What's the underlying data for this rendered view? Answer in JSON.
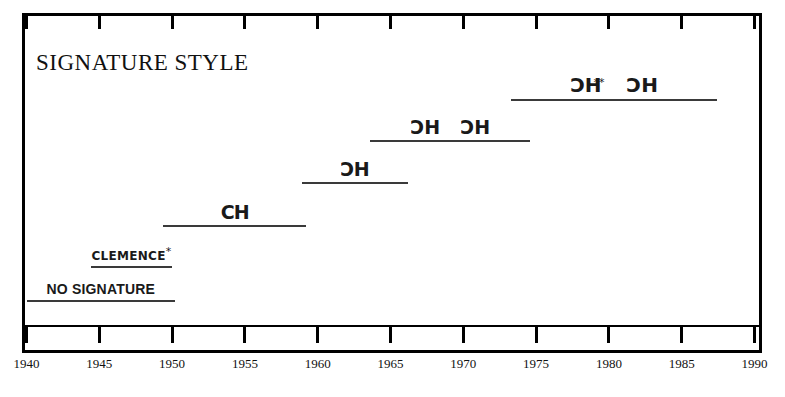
{
  "chart_data": {
    "type": "bar",
    "orientation": "horizontal-timeline",
    "title": "SIGNATURE STYLE",
    "xlabel": "",
    "ylabel": "",
    "xlim": [
      1940,
      1990
    ],
    "grid": false,
    "legend": false,
    "tick_labels": [
      "1940",
      "1945",
      "1950",
      "1955",
      "1960",
      "1965",
      "1970",
      "1975",
      "1980",
      "1985",
      "1990"
    ],
    "tick_values": [
      1940,
      1945,
      1950,
      1955,
      1960,
      1965,
      1970,
      1975,
      1980,
      1985,
      1990
    ],
    "series": [
      {
        "name": "NO SIGNATURE",
        "label": "NO SIGNATURE",
        "label_style": "bold-caps",
        "start": 1940,
        "end": 1950.2,
        "row": 0
      },
      {
        "name": "CLEMENCE",
        "label": "CLEMENCE",
        "label_mark": "*",
        "label_style": "hand-caps",
        "start": 1944.4,
        "end": 1950.0,
        "row": 1
      },
      {
        "name": "CH upright monogram",
        "label": "CH",
        "label_style": "monogram-upright",
        "start": 1949.4,
        "end": 1959.2,
        "row": 2
      },
      {
        "name": "CH reversed-C monogram",
        "label": "CH",
        "label_style": "monogram-reversed",
        "start": 1958.9,
        "end": 1966.2,
        "row": 3
      },
      {
        "name": "CH reversed-C monogram pair",
        "label": "CH CH",
        "label_style": "monogram-reversed-pair",
        "start": 1963.6,
        "end": 1974.6,
        "row": 4
      },
      {
        "name": "CH ligature monogram pair",
        "label": "CH CH",
        "label_mark": "**",
        "label_style": "monogram-ligature-pair",
        "start": 1973.3,
        "end": 1987.4,
        "row": 5
      }
    ]
  },
  "chart": {
    "title": "SIGNATURE STYLE",
    "axis": {
      "ticks": [
        {
          "label": "1940",
          "value": 1940
        },
        {
          "label": "1945",
          "value": 1945
        },
        {
          "label": "1950",
          "value": 1950
        },
        {
          "label": "1955",
          "value": 1955
        },
        {
          "label": "1960",
          "value": 1960
        },
        {
          "label": "1965",
          "value": 1965
        },
        {
          "label": "1970",
          "value": 1970
        },
        {
          "label": "1975",
          "value": 1975
        },
        {
          "label": "1980",
          "value": 1980
        },
        {
          "label": "1985",
          "value": 1985
        },
        {
          "label": "1990",
          "value": 1990
        }
      ]
    },
    "bars": [
      {
        "label": "NO SIGNATURE",
        "mark": ""
      },
      {
        "label": "CLEMENCE",
        "mark": "*"
      },
      {
        "label": "CH",
        "mark": ""
      },
      {
        "label": "CH",
        "mark": ""
      },
      {
        "label": "CH",
        "mark": ""
      },
      {
        "label": "CH",
        "mark": "**"
      }
    ]
  }
}
